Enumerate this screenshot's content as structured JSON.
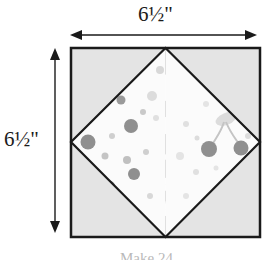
{
  "diagram": {
    "type": "quilt-block-square-in-a-square",
    "title_caption": "Make 24",
    "dimensions": {
      "top_label": "6½\"",
      "left_label": "6½\"",
      "width_value": 6.5,
      "height_value": 6.5,
      "unit": "inch"
    },
    "colors": {
      "background": "#ffffff",
      "corner_triangle_fill": "#e4e4e4",
      "floral_diamond_fill": "#8c8c8c",
      "floral_motif": "#ffffff",
      "dot_diamond_fill": "#fbfbfb",
      "dot_motif": "#9a9a9a",
      "outline": "#1a1a1a",
      "arrow": "#1a1a1a"
    },
    "square": {
      "x": 71,
      "y": 48,
      "size": 189,
      "stroke_width": 2.5
    },
    "patches": [
      {
        "name": "corner-triangle-top-left",
        "fill": "corner_triangle_fill"
      },
      {
        "name": "corner-triangle-top-right",
        "fill": "corner_triangle_fill"
      },
      {
        "name": "corner-triangle-bottom-left",
        "fill": "corner_triangle_fill"
      },
      {
        "name": "corner-triangle-bottom-right",
        "fill": "corner_triangle_fill"
      },
      {
        "name": "diamond-top",
        "fill": "floral_diamond_fill",
        "motif": "flowers"
      },
      {
        "name": "diamond-bottom",
        "fill": "floral_diamond_fill",
        "motif": "flowers"
      },
      {
        "name": "diamond-left",
        "fill": "dot_diamond_fill",
        "motif": "dots"
      },
      {
        "name": "diamond-right",
        "fill": "dot_diamond_fill",
        "motif": "cherries-and-dots"
      }
    ],
    "arrows": {
      "horizontal": {
        "x1": 70,
        "x2": 257,
        "y": 35
      },
      "vertical": {
        "y1": 48,
        "y2": 233,
        "x": 55
      }
    }
  }
}
